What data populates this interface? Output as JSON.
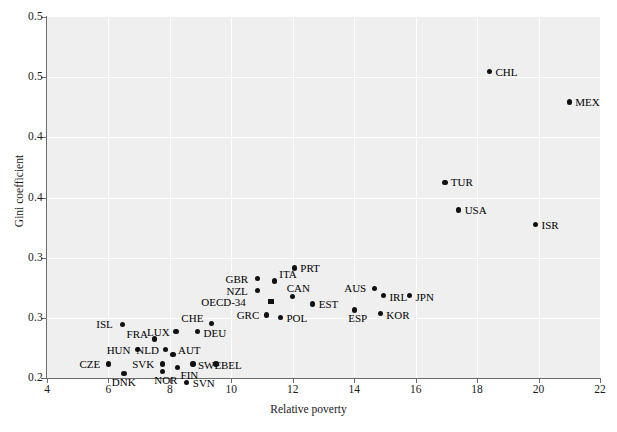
{
  "chart_data": {
    "type": "scatter",
    "title": "",
    "xlabel": "Relative poverty",
    "ylabel": "Gini coefficient",
    "xlim": [
      4,
      22
    ],
    "ylim": [
      0.25,
      0.55
    ],
    "xticks": [
      4,
      6,
      8,
      10,
      12,
      14,
      16,
      18,
      20,
      22
    ],
    "xtick_labels": [
      "4",
      "6",
      "8",
      "10",
      "12",
      "14",
      "16",
      "18",
      "20",
      "22"
    ],
    "yticks": [
      0.25,
      0.3,
      0.35,
      0.4,
      0.45,
      0.5,
      0.55
    ],
    "ytick_labels": [
      "0.2",
      "0.3",
      "0.3",
      "0.4",
      "0.4",
      "0.5",
      "0.5"
    ],
    "grid": true,
    "legend": "none",
    "plot_background": "#efefef",
    "marker_color": "#111111",
    "points": [
      {
        "label": "CHL",
        "x": 18.4,
        "y": 0.5045,
        "lx": 6,
        "ly": -5,
        "marker": "circle"
      },
      {
        "label": "MEX",
        "x": 21.0,
        "y": 0.4795,
        "lx": 6,
        "ly": -5,
        "marker": "circle"
      },
      {
        "label": "TUR",
        "x": 16.95,
        "y": 0.4125,
        "lx": 6,
        "ly": -5,
        "marker": "circle"
      },
      {
        "label": "USA",
        "x": 17.4,
        "y": 0.3895,
        "lx": 6,
        "ly": -5,
        "marker": "circle"
      },
      {
        "label": "ISR",
        "x": 19.9,
        "y": 0.3775,
        "lx": 6,
        "ly": -5,
        "marker": "circle"
      },
      {
        "label": "PRT",
        "x": 12.05,
        "y": 0.3415,
        "lx": 6,
        "ly": -5,
        "marker": "circle"
      },
      {
        "label": "ITA",
        "x": 11.4,
        "y": 0.3305,
        "lx": 5,
        "ly": -12,
        "marker": "circle"
      },
      {
        "label": "GBR",
        "x": 10.85,
        "y": 0.3325,
        "lx": -32,
        "ly": -5,
        "marker": "circle"
      },
      {
        "label": "NZL",
        "x": 10.85,
        "y": 0.3225,
        "lx": -31,
        "ly": -5,
        "marker": "circle"
      },
      {
        "label": "CAN",
        "x": 12.0,
        "y": 0.3175,
        "lx": -6,
        "ly": -14,
        "marker": "circle"
      },
      {
        "label": "OECD-34",
        "x": 11.3,
        "y": 0.3135,
        "lx": -55,
        "ly": -5,
        "marker": "square"
      },
      {
        "label": "EST",
        "x": 12.65,
        "y": 0.3115,
        "lx": 6,
        "ly": -5,
        "marker": "circle"
      },
      {
        "label": "GRC",
        "x": 11.15,
        "y": 0.3025,
        "lx": -30,
        "ly": -5,
        "marker": "circle"
      },
      {
        "label": "POL",
        "x": 11.6,
        "y": 0.3005,
        "lx": 6,
        "ly": -4,
        "marker": "circle"
      },
      {
        "label": "AUS",
        "x": 14.65,
        "y": 0.3245,
        "lx": -30,
        "ly": -5,
        "marker": "circle"
      },
      {
        "label": "IRL",
        "x": 14.95,
        "y": 0.3185,
        "lx": 6,
        "ly": -4,
        "marker": "circle"
      },
      {
        "label": "JPN",
        "x": 15.8,
        "y": 0.3185,
        "lx": 6,
        "ly": -4,
        "marker": "circle"
      },
      {
        "label": "ESP",
        "x": 14.0,
        "y": 0.3065,
        "lx": -6,
        "ly": 3,
        "marker": "circle"
      },
      {
        "label": "KOR",
        "x": 14.85,
        "y": 0.3035,
        "lx": 6,
        "ly": -4,
        "marker": "circle"
      },
      {
        "label": "CHE",
        "x": 9.35,
        "y": 0.2955,
        "lx": -30,
        "ly": -10,
        "marker": "circle"
      },
      {
        "label": "DEU",
        "x": 8.9,
        "y": 0.2885,
        "lx": 6,
        "ly": -4,
        "marker": "circle"
      },
      {
        "label": "ISL",
        "x": 6.45,
        "y": 0.2945,
        "lx": -26,
        "ly": -5,
        "marker": "circle"
      },
      {
        "label": "LUX",
        "x": 8.2,
        "y": 0.2885,
        "lx": -29,
        "ly": -5,
        "marker": "circle"
      },
      {
        "label": "FRA",
        "x": 7.5,
        "y": 0.2825,
        "lx": -28,
        "ly": -10,
        "marker": "circle"
      },
      {
        "label": "HUN",
        "x": 6.95,
        "y": 0.2735,
        "lx": -31,
        "ly": -5,
        "marker": "circle"
      },
      {
        "label": "NLD",
        "x": 7.85,
        "y": 0.2735,
        "lx": -29,
        "ly": -5,
        "marker": "circle"
      },
      {
        "label": "AUT",
        "x": 8.1,
        "y": 0.2695,
        "lx": 5,
        "ly": -10,
        "marker": "circle"
      },
      {
        "label": "CZE",
        "x": 6.0,
        "y": 0.2615,
        "lx": -29,
        "ly": -5,
        "marker": "circle"
      },
      {
        "label": "SVK",
        "x": 7.75,
        "y": 0.2615,
        "lx": -30,
        "ly": -5,
        "marker": "circle"
      },
      {
        "label": "SWE",
        "x": 8.75,
        "y": 0.2615,
        "lx": 5,
        "ly": -4,
        "marker": "circle"
      },
      {
        "label": "BEL",
        "x": 9.5,
        "y": 0.2615,
        "lx": 5,
        "ly": -4,
        "marker": "circle"
      },
      {
        "label": "FIN",
        "x": 8.25,
        "y": 0.2585,
        "lx": 3,
        "ly": 2,
        "marker": "circle"
      },
      {
        "label": "NOR",
        "x": 7.75,
        "y": 0.2555,
        "lx": -8,
        "ly": 4,
        "marker": "circle"
      },
      {
        "label": "DNK",
        "x": 6.5,
        "y": 0.2535,
        "lx": -12,
        "ly": 3,
        "marker": "circle"
      },
      {
        "label": "SVN",
        "x": 8.55,
        "y": 0.2465,
        "lx": 6,
        "ly": -4,
        "marker": "circle"
      }
    ]
  },
  "caption": ""
}
